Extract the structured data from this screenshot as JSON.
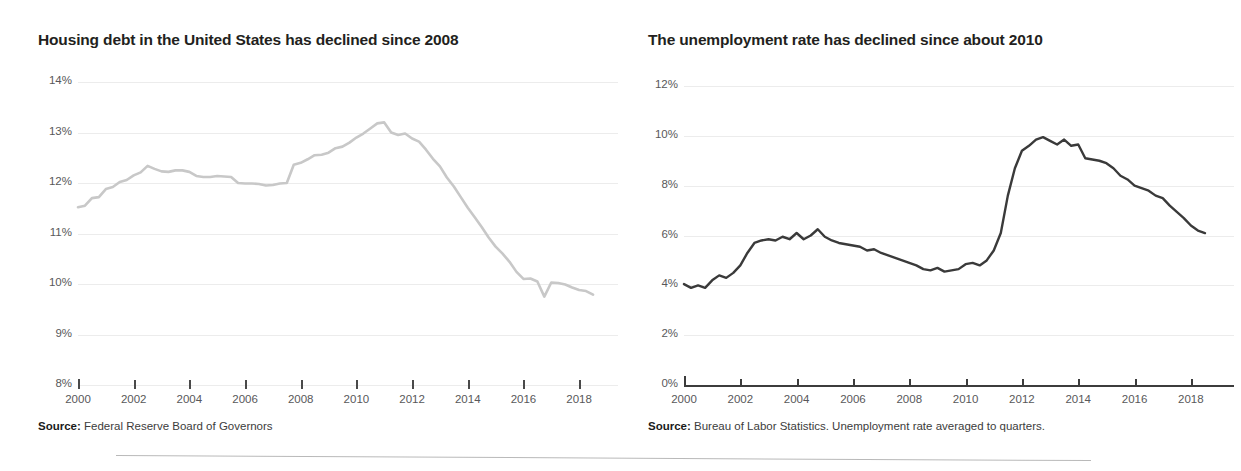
{
  "page": {
    "background": "#ffffff",
    "separator_color": "#b9b9b9"
  },
  "charts": [
    {
      "id": "housing-debt",
      "title": "Housing debt in the United States has declined since 2008",
      "source_label": "Source:",
      "source_text": " Federal Reserve Board of Governors",
      "line_color": "#c8c8c8",
      "grid_color": "#ececec",
      "tick_color": "#4a4a4a"
    },
    {
      "id": "unemployment-rate",
      "title": "The unemployment rate has declined since about 2010",
      "source_label": "Source:",
      "source_text": " Bureau of Labor Statistics. Unemployment rate averaged to quarters.",
      "line_color": "#3a3a3a",
      "grid_color": "#ececec",
      "tick_color": "#3c3c3c"
    }
  ],
  "chart_data": [
    {
      "type": "line",
      "id": "housing-debt",
      "title": "Housing debt in the United States has declined since 2008",
      "xlabel": "",
      "ylabel": "",
      "xlim": [
        2000,
        2018.75
      ],
      "ylim": [
        8,
        14
      ],
      "yticks": [
        14,
        13,
        12,
        11,
        10,
        9,
        8
      ],
      "ytick_labels": [
        "14%",
        "13%",
        "12%",
        "11%",
        "10%",
        "9%",
        "8%"
      ],
      "xticks": [
        2000,
        2002,
        2004,
        2006,
        2008,
        2010,
        2012,
        2014,
        2016,
        2018
      ],
      "xtick_labels": [
        "2000",
        "2002",
        "2004",
        "2006",
        "2008",
        "2010",
        "2012",
        "2014",
        "2016",
        "2018"
      ],
      "grid": true,
      "legend": "none",
      "series": [
        {
          "name": "Housing debt as share of GDP",
          "units": "percent",
          "x": [
            2000.0,
            2000.25,
            2000.5,
            2000.75,
            2001.0,
            2001.25,
            2001.5,
            2001.75,
            2002.0,
            2002.25,
            2002.5,
            2002.75,
            2003.0,
            2003.25,
            2003.5,
            2003.75,
            2004.0,
            2004.25,
            2004.5,
            2004.75,
            2005.0,
            2005.25,
            2005.5,
            2005.75,
            2006.0,
            2006.25,
            2006.5,
            2006.75,
            2007.0,
            2007.25,
            2007.5,
            2007.75,
            2008.0,
            2008.25,
            2008.5,
            2008.75,
            2009.0,
            2009.25,
            2009.5,
            2009.75,
            2010.0,
            2010.25,
            2010.5,
            2010.75,
            2011.0,
            2011.25,
            2011.5,
            2011.75,
            2012.0,
            2012.25,
            2012.5,
            2012.75,
            2013.0,
            2013.25,
            2013.5,
            2013.75,
            2014.0,
            2014.25,
            2014.5,
            2014.75,
            2015.0,
            2015.25,
            2015.5,
            2015.75,
            2016.0,
            2016.25,
            2016.5,
            2016.75,
            2017.0,
            2017.25,
            2017.5,
            2017.75,
            2018.0,
            2018.25,
            2018.5
          ],
          "y": [
            11.52,
            11.55,
            11.7,
            11.72,
            11.88,
            11.92,
            12.02,
            12.06,
            12.15,
            12.21,
            12.34,
            12.28,
            12.23,
            12.22,
            12.25,
            12.25,
            12.22,
            12.14,
            12.12,
            12.12,
            12.14,
            12.13,
            12.12,
            12.0,
            11.99,
            11.99,
            11.98,
            11.95,
            11.96,
            11.99,
            12.0,
            12.36,
            12.4,
            12.47,
            12.55,
            12.56,
            12.6,
            12.69,
            12.72,
            12.8,
            12.9,
            12.98,
            13.08,
            13.18,
            13.2,
            13.0,
            12.95,
            12.98,
            12.88,
            12.82,
            12.66,
            12.48,
            12.33,
            12.11,
            11.93,
            11.72,
            11.51,
            11.32,
            11.13,
            10.92,
            10.74,
            10.6,
            10.44,
            10.24,
            10.1,
            10.11,
            10.05,
            9.75,
            10.03,
            10.02,
            9.99,
            9.93,
            9.88,
            9.86,
            9.79
          ]
        }
      ],
      "annotations": [
        {
          "text": "peak near 13.2% in 2011",
          "x": 2011.0,
          "y": 13.2
        },
        {
          "text": "sharp one-quarter dip near 9.75% in late 2012",
          "x": 2012.75,
          "y": 9.75
        }
      ]
    },
    {
      "type": "line",
      "id": "unemployment-rate",
      "title": "The unemployment rate has declined since about 2010",
      "xlabel": "",
      "ylabel": "",
      "xlim": [
        2000,
        2018.75
      ],
      "ylim": [
        0,
        12
      ],
      "yticks": [
        12,
        10,
        8,
        6,
        4,
        2,
        0
      ],
      "ytick_labels": [
        "12%",
        "10%",
        "8%",
        "6%",
        "4%",
        "2%",
        "0%"
      ],
      "xticks": [
        2000,
        2002,
        2004,
        2006,
        2008,
        2010,
        2012,
        2014,
        2016,
        2018
      ],
      "xtick_labels": [
        "2000",
        "2002",
        "2004",
        "2006",
        "2008",
        "2010",
        "2012",
        "2014",
        "2016",
        "2018"
      ],
      "grid": true,
      "legend": "none",
      "series": [
        {
          "name": "Unemployment rate (quarterly average)",
          "units": "percent",
          "x": [
            2000.0,
            2000.25,
            2000.5,
            2000.75,
            2001.0,
            2001.25,
            2001.5,
            2001.75,
            2002.0,
            2002.25,
            2002.5,
            2002.75,
            2003.0,
            2003.25,
            2003.5,
            2003.75,
            2004.0,
            2004.25,
            2004.5,
            2004.75,
            2005.0,
            2005.25,
            2005.5,
            2005.75,
            2006.0,
            2006.25,
            2006.5,
            2006.75,
            2007.0,
            2007.25,
            2007.5,
            2007.75,
            2008.0,
            2008.25,
            2008.5,
            2008.75,
            2009.0,
            2009.25,
            2009.5,
            2009.75,
            2010.0,
            2010.25,
            2010.5,
            2010.75,
            2011.0,
            2011.25,
            2011.5,
            2011.75,
            2012.0,
            2012.25,
            2012.5,
            2012.75,
            2013.0,
            2013.25,
            2013.5,
            2013.75,
            2014.0,
            2014.25,
            2014.5,
            2014.75,
            2015.0,
            2015.25,
            2015.5,
            2015.75,
            2016.0,
            2016.25,
            2016.5,
            2016.75,
            2017.0,
            2017.25,
            2017.5,
            2017.75,
            2018.0,
            2018.25,
            2018.5
          ],
          "y": [
            4.05,
            3.9,
            4.0,
            3.9,
            4.2,
            4.4,
            4.3,
            4.5,
            4.8,
            5.3,
            5.7,
            5.8,
            5.85,
            5.8,
            5.95,
            5.85,
            6.1,
            5.85,
            6.0,
            6.25,
            5.95,
            5.8,
            5.7,
            5.65,
            5.6,
            5.55,
            5.4,
            5.45,
            5.3,
            5.2,
            5.1,
            5.0,
            4.9,
            4.8,
            4.65,
            4.6,
            4.7,
            4.55,
            4.6,
            4.65,
            4.85,
            4.9,
            4.8,
            5.0,
            5.4,
            6.1,
            7.6,
            8.7,
            9.4,
            9.6,
            9.85,
            9.95,
            9.8,
            9.65,
            9.85,
            9.6,
            9.65,
            9.1,
            9.05,
            9.0,
            8.9,
            8.7,
            8.4,
            8.25,
            8.0,
            7.9,
            7.8,
            7.6,
            7.5,
            7.2,
            6.95,
            6.7,
            6.4,
            6.2,
            6.1
          ]
        }
      ],
      "annotations": [
        {
          "text": "peak near 10% in 2010",
          "x": 2010.0,
          "y": 9.95
        },
        {
          "text": "declines to about 3.8% by 2018",
          "x": 2018.5,
          "y": 3.8
        }
      ]
    }
  ]
}
